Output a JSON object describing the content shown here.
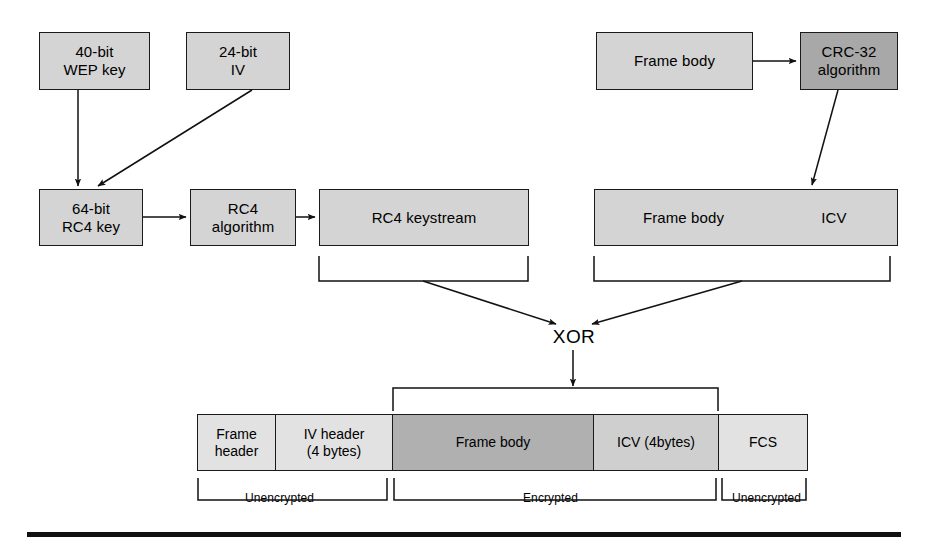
{
  "figure": {
    "colors": {
      "box_fill": "#d4d4d4",
      "box_fill_dark": "#a8a8a8",
      "box_fill_light": "#e2e2e2",
      "frame_body_fill": "#b0b0b0",
      "stroke": "#1a1a1a",
      "rule": "#111111"
    }
  },
  "key_chain": {
    "wep_key": "40-bit\nWEP key",
    "iv": "24-bit\nIV",
    "rc4_key": "64-bit\nRC4 key",
    "rc4_algorithm": "RC4\nalgorithm",
    "rc4_keystream": "RC4 keystream"
  },
  "integrity_chain": {
    "frame_body": "Frame body",
    "crc32": "CRC-32\nalgorithm",
    "frame_body_2": "Frame body",
    "icv": "ICV"
  },
  "combine": {
    "operator": "XOR"
  },
  "output_frame": {
    "cells": [
      {
        "label": "Frame\nheader",
        "shade": "light"
      },
      {
        "label": "IV header\n(4 bytes)",
        "shade": "light"
      },
      {
        "label": "Frame body",
        "shade": "mid"
      },
      {
        "label": "ICV (4bytes)",
        "shade": "midlight"
      },
      {
        "label": "FCS",
        "shade": "light"
      }
    ],
    "brackets": [
      {
        "label": "Unencrypted"
      },
      {
        "label": "Encrypted"
      },
      {
        "label": "Unencrypted"
      }
    ]
  }
}
